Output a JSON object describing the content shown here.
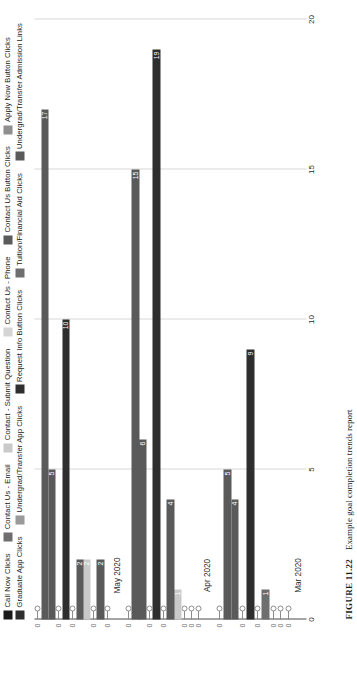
{
  "figure": {
    "number": "FIGURE 11.22",
    "caption": "Example goal completion trends report"
  },
  "chart_data": {
    "type": "bar",
    "orientation": "horizontal",
    "title": "",
    "xlabel": "",
    "ylabel": "",
    "categories": [
      "Mar 2020",
      "Apr 2020",
      "May 2020"
    ],
    "value_axis_ticks": [
      "0",
      "5",
      "10",
      "15",
      "20"
    ],
    "ylim": [
      0,
      20
    ],
    "grid": true,
    "legend_position": "top",
    "series": [
      {
        "name": "Call Now Clicks",
        "color": "#1a1a1a",
        "values": [
          0,
          0,
          0
        ]
      },
      {
        "name": "Apply Now Button Clicks",
        "color": "#8f8f8f",
        "values": [
          0,
          0,
          2
        ]
      },
      {
        "name": "Tuition/Financial Aid Clicks",
        "color": "#6e6e6e",
        "values": [
          0,
          0,
          0
        ]
      },
      {
        "name": "Contact Us - Email",
        "color": "#6e6e6e",
        "values": [
          1,
          1,
          2
        ]
      },
      {
        "name": "Graduate App Clicks",
        "color": "#2e2e2e",
        "values": [
          0,
          4,
          2
        ]
      },
      {
        "name": "Undergrad/Transfer App Clicks",
        "color": "#5a5a5a",
        "values": [
          0,
          0,
          0
        ]
      },
      {
        "name": "Contact - Submit Question",
        "color": "#c9c9c9",
        "values": [
          9,
          19,
          10
        ]
      },
      {
        "name": "Undergrad/Transfer Admission Links",
        "color": "#2e2e2e",
        "values": [
          0,
          0,
          0
        ]
      },
      {
        "name": "Contact Us - Phone",
        "color": "#d5d5d5",
        "values": [
          4,
          6,
          5
        ]
      },
      {
        "name": "Contact Us Button Clicks",
        "color": "#5a5a5a",
        "values": [
          5,
          15,
          17
        ]
      },
      {
        "name": "Request Info Button Clicks",
        "color": "#2e2e2e",
        "values": [
          0,
          0,
          0
        ]
      }
    ],
    "bar_order_bottom_to_top": [
      "Call Now Clicks",
      "Apply Now Button Clicks",
      "Tuition/Financial Aid Clicks",
      "Contact Us - Email",
      "Graduate App Clicks",
      "Undergrad/Transfer App Clicks",
      "Contact - Submit Question",
      "Undergrad/Transfer Admission Links",
      "Contact Us - Phone",
      "Contact Us Button Clicks",
      "Request Info Button Clicks"
    ],
    "groups": [
      {
        "label": "Mar 2020",
        "bars": [
          {
            "series": "Call Now Clicks",
            "value": 0,
            "color": "#1a1a1a"
          },
          {
            "series": "Apply Now Button Clicks",
            "value": 0,
            "color": "#8f8f8f"
          },
          {
            "series": "Tuition/Financial Aid Clicks",
            "value": 0,
            "color": "#6e6e6e"
          },
          {
            "series": "Contact Us - Email",
            "value": 1,
            "color": "#6e6e6e"
          },
          {
            "series": "Graduate App Clicks",
            "value": 0,
            "color": "#2e2e2e"
          },
          {
            "series": "Undergrad/Transfer App Clicks",
            "value": 9,
            "color": "#2e2e2e"
          },
          {
            "series": "Contact - Submit Question",
            "value": 0,
            "color": "#c9c9c9"
          },
          {
            "series": "Undergrad/Transfer Admission Links",
            "value": 4,
            "color": "#5a5a5a"
          },
          {
            "series": "Contact Us - Phone",
            "value": 5,
            "color": "#5a5a5a"
          },
          {
            "series": "Contact Us Button Clicks",
            "value": 0,
            "color": "#2e2e2e"
          }
        ]
      },
      {
        "label": "Apr 2020",
        "bars": [
          {
            "series": "Call Now Clicks",
            "value": 0,
            "color": "#1a1a1a"
          },
          {
            "series": "Apply Now Button Clicks",
            "value": 0,
            "color": "#8f8f8f"
          },
          {
            "series": "Tuition/Financial Aid Clicks",
            "value": 0,
            "color": "#6e6e6e"
          },
          {
            "series": "Contact Us - Email",
            "value": 1,
            "color": "#c9c9c9"
          },
          {
            "series": "Graduate App Clicks",
            "value": 4,
            "color": "#5a5a5a"
          },
          {
            "series": "Undergrad/Transfer App Clicks",
            "value": 0,
            "color": "#6e6e6e"
          },
          {
            "series": "Contact - Submit Question",
            "value": 19,
            "color": "#2e2e2e"
          },
          {
            "series": "Undergrad/Transfer Admission Links",
            "value": 0,
            "color": "#6e6e6e"
          },
          {
            "series": "Contact Us - Phone",
            "value": 6,
            "color": "#5a5a5a"
          },
          {
            "series": "Contact Us Button Clicks",
            "value": 15,
            "color": "#5a5a5a"
          },
          {
            "series": "Request Info Button Clicks",
            "value": 0,
            "color": "#2e2e2e"
          }
        ]
      },
      {
        "label": "May 2020",
        "bars": [
          {
            "series": "Call Now Clicks",
            "value": 0,
            "color": "#1a1a1a"
          },
          {
            "series": "Apply Now Button Clicks",
            "value": 2,
            "color": "#5a5a5a"
          },
          {
            "series": "Tuition/Financial Aid Clicks",
            "value": 0,
            "color": "#6e6e6e"
          },
          {
            "series": "Contact Us - Email",
            "value": 2,
            "color": "#c9c9c9"
          },
          {
            "series": "Graduate App Clicks",
            "value": 2,
            "color": "#5a5a5a"
          },
          {
            "series": "Undergrad/Transfer App Clicks",
            "value": 0,
            "color": "#6e6e6e"
          },
          {
            "series": "Contact - Submit Question",
            "value": 10,
            "color": "#2e2e2e"
          },
          {
            "series": "Undergrad/Transfer Admission Links",
            "value": 0,
            "color": "#6e6e6e"
          },
          {
            "series": "Contact Us - Phone",
            "value": 5,
            "color": "#5a5a5a"
          },
          {
            "series": "Contact Us Button Clicks",
            "value": 17,
            "color": "#5a5a5a"
          },
          {
            "series": "Request Info Button Clicks",
            "value": 0,
            "color": "#2e2e2e"
          }
        ]
      }
    ]
  },
  "legend": {
    "items": [
      {
        "label": "Call Now Clicks",
        "color": "#1a1a1a"
      },
      {
        "label": "Contact Us - Email",
        "color": "#6e6e6e"
      },
      {
        "label": "Contact - Submit Question",
        "color": "#c9c9c9"
      },
      {
        "label": "Contact Us - Phone",
        "color": "#d5d5d5"
      },
      {
        "label": "Contact Us Button Clicks",
        "color": "#5a5a5a"
      },
      {
        "label": "Apply Now Button Clicks",
        "color": "#8f8f8f"
      },
      {
        "label": "Graduate App Clicks",
        "color": "#2e2e2e"
      },
      {
        "label": "Undergrad/Transfer App Clicks",
        "color": "#9a9a9a"
      },
      {
        "label": "Request Info Button Clicks",
        "color": "#2e2e2e"
      },
      {
        "label": "Tuition/Financial Aid Clicks",
        "color": "#6e6e6e"
      },
      {
        "label": "Undergrad/Transfer Admission Links",
        "color": "#5a5a5a"
      }
    ]
  }
}
